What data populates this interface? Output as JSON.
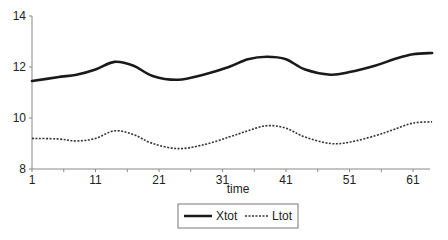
{
  "chart_data": {
    "type": "line",
    "title": "",
    "xlabel": "time",
    "ylabel": "",
    "xlim": [
      1,
      64
    ],
    "ylim": [
      8,
      14
    ],
    "x_ticks": [
      1,
      11,
      21,
      31,
      41,
      51,
      61
    ],
    "y_ticks": [
      8,
      10,
      12,
      14
    ],
    "grid": false,
    "legend_position": "bottom",
    "x": [
      1,
      5,
      8,
      11,
      14,
      17,
      20,
      24,
      28,
      32,
      35,
      38,
      41,
      44,
      48,
      51,
      55,
      58,
      61,
      64
    ],
    "series": [
      {
        "name": "Xtot",
        "style": "solid",
        "color": "#1a1a1a",
        "values": [
          11.45,
          11.6,
          11.7,
          11.9,
          12.2,
          12.05,
          11.65,
          11.5,
          11.7,
          12.0,
          12.3,
          12.4,
          12.3,
          11.9,
          11.7,
          11.8,
          12.05,
          12.3,
          12.5,
          12.55
        ]
      },
      {
        "name": "Ltot",
        "style": "dashed",
        "color": "#333333",
        "values": [
          9.2,
          9.18,
          9.1,
          9.2,
          9.5,
          9.35,
          9.0,
          8.8,
          8.95,
          9.25,
          9.5,
          9.7,
          9.6,
          9.25,
          9.0,
          9.05,
          9.3,
          9.55,
          9.8,
          9.85
        ]
      }
    ]
  }
}
